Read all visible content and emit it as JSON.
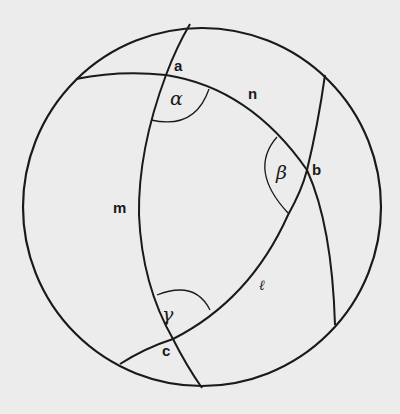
{
  "diagram": {
    "colors": {
      "background": "#ececec",
      "stroke": "#1a1a1a"
    },
    "vertices": {
      "a": "a",
      "b": "b",
      "c": "c"
    },
    "arcs": {
      "l": "ℓ",
      "m": "m",
      "n": "n"
    },
    "angles": {
      "alpha": "α",
      "beta": "β",
      "gamma": "γ"
    }
  }
}
